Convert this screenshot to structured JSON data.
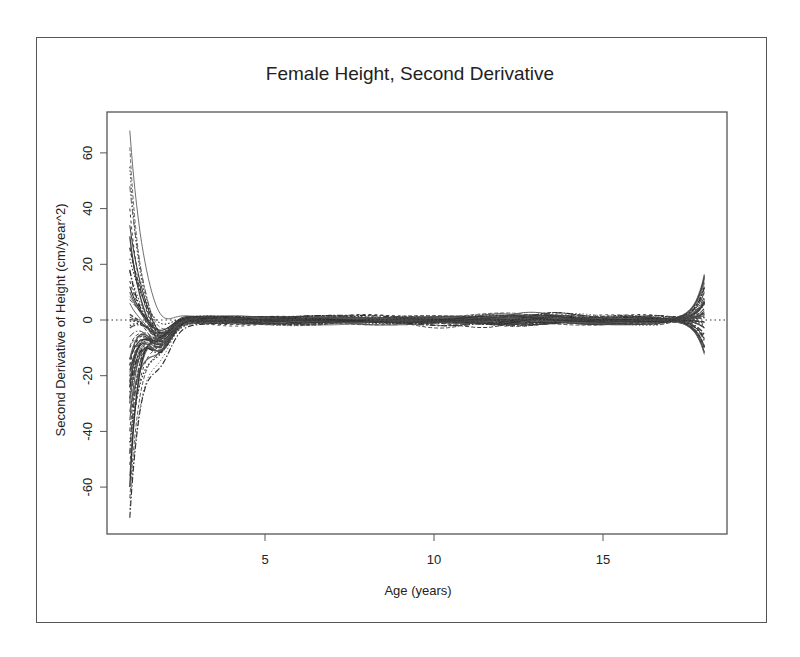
{
  "chart_data": {
    "type": "line",
    "title": "Female Height, Second Derivative",
    "xlabel": "Age (years)",
    "ylabel": "Second Derivative of Height (cm/year^2)",
    "xlim": [
      0.3,
      18.7
    ],
    "ylim": [
      -76,
      76
    ],
    "x_ticks": [
      5,
      10,
      15
    ],
    "y_ticks": [
      -60,
      -40,
      -20,
      0,
      20,
      40,
      60
    ],
    "reference_line": {
      "y": 0,
      "style": "dotted"
    },
    "grid": false,
    "legend": null,
    "x_range_of_curves": [
      1,
      18
    ],
    "n_series_approx": 54,
    "series_summary": [
      {
        "age": 1,
        "min": -71,
        "max": 68
      },
      {
        "age": 1.5,
        "min": -30,
        "max": 10
      },
      {
        "age": 2,
        "min": -12,
        "max": 4
      },
      {
        "age": 3,
        "min": -5,
        "max": 4
      },
      {
        "age": 4,
        "min": -3,
        "max": 5
      },
      {
        "age": 5,
        "min": -4,
        "max": 3
      },
      {
        "age": 7,
        "min": -2,
        "max": 2
      },
      {
        "age": 10,
        "min": -1,
        "max": 3
      },
      {
        "age": 12,
        "min": -5,
        "max": 2
      },
      {
        "age": 14,
        "min": -3,
        "max": 1
      },
      {
        "age": 16,
        "min": -1,
        "max": 1
      },
      {
        "age": 17,
        "min": -3,
        "max": 3
      },
      {
        "age": 18,
        "min": -12,
        "max": 19
      }
    ],
    "start_values": [
      68,
      62,
      55,
      48,
      40,
      34,
      30,
      26,
      22,
      18,
      14,
      10,
      6,
      2,
      -2,
      -6,
      -10,
      -14,
      -18,
      -22,
      -26,
      -28,
      -30,
      -33,
      -36,
      -40,
      -44,
      -48,
      -52,
      -56,
      -60,
      -64,
      -68,
      -71
    ],
    "end_values": [
      19,
      15,
      12,
      9,
      7,
      5,
      3,
      1,
      -1,
      -3,
      -5,
      -7,
      -9,
      -12
    ]
  },
  "axes": {
    "x_tick_labels": [
      "5",
      "10",
      "15"
    ],
    "y_tick_labels": [
      "60",
      "40",
      "20",
      "0",
      "-20",
      "-40",
      "-60"
    ]
  }
}
